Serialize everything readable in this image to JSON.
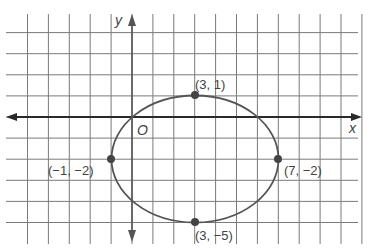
{
  "diagram": {
    "type": "coordinate-plane-ellipse",
    "axes": {
      "x_label": "x",
      "y_label": "y",
      "origin_label": "O"
    },
    "ellipse": {
      "center": [
        3,
        -2
      ],
      "horizontal_radius": 4,
      "vertical_radius": 3
    },
    "points": [
      {
        "x": 3,
        "y": 1,
        "label": "(3, 1)"
      },
      {
        "x": -1,
        "y": -2,
        "label": "(−1, −2)"
      },
      {
        "x": 7,
        "y": -2,
        "label": "(7, −2)"
      },
      {
        "x": 3,
        "y": -5,
        "label": "(3, −5)"
      }
    ],
    "grid": {
      "x_range": [
        -5,
        11
      ],
      "y_range": [
        -6,
        4
      ]
    }
  }
}
